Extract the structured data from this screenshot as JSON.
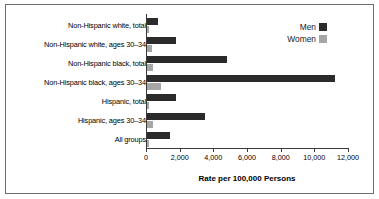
{
  "chart_data": {
    "type": "bar",
    "orientation": "horizontal",
    "title": "",
    "xlabel": "Rate per 100,000 Persons",
    "ylabel": "",
    "xlim": [
      0,
      12000
    ],
    "xticks": [
      0,
      2000,
      4000,
      6000,
      8000,
      10000,
      12000
    ],
    "xtick_labels": [
      "0",
      "2,000",
      "4,000",
      "6,000",
      "8,000",
      "10,000",
      "12,000"
    ],
    "grid": false,
    "legend_position": "top-right",
    "categories": [
      "Non-Hispanic white, total",
      "Non-Hispanic white, ages 30–34",
      "Non-Hispanic black, total",
      "Non-Hispanic black, ages 30–34",
      "Hispanic, total",
      "Hispanic, ages 30–34",
      "All groups"
    ],
    "series": [
      {
        "name": "Men",
        "color": "#2b2b2b",
        "values": [
          700,
          1800,
          4800,
          11200,
          1800,
          3500,
          1400
        ]
      },
      {
        "name": "Women",
        "color": "#a6a6a6",
        "values": [
          150,
          350,
          400,
          900,
          200,
          400,
          200
        ]
      }
    ]
  },
  "legend": {
    "items": [
      {
        "label": "Men",
        "color": "#2b2b2b"
      },
      {
        "label": "Women",
        "color": "#a6a6a6"
      }
    ]
  },
  "axis": {
    "line_color": "#3a3a3a"
  },
  "frame": {
    "border_color": "#6d6d6d"
  }
}
